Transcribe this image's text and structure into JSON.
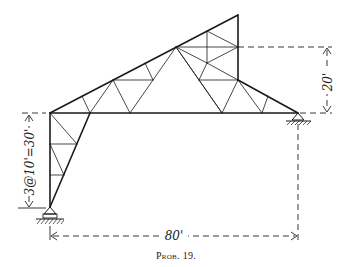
{
  "figure": {
    "caption": "Prob. 19.",
    "dimensions": {
      "left_height": "3@10'=30'",
      "right_height": "20'",
      "span": "80'"
    },
    "colors": {
      "ink": "#1a1a1a",
      "background": "#ffffff"
    }
  }
}
